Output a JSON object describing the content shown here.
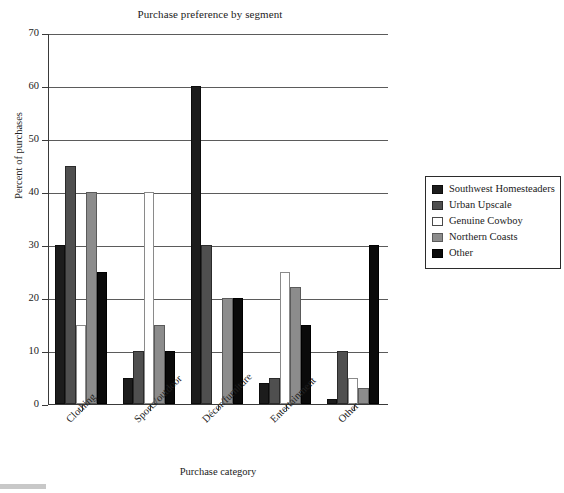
{
  "chart_data": {
    "type": "bar",
    "title": "Purchase preference by segment",
    "xlabel": "Purchase category",
    "ylabel": "Percent of purchases",
    "categories": [
      "Clothing",
      "Sports/outdoor",
      "Décor/furniture",
      "Entertainment",
      "Other"
    ],
    "series": [
      {
        "name": "Southwest Homesteaders",
        "color": "#1c1c1c",
        "values": [
          30,
          5,
          60,
          4,
          1
        ]
      },
      {
        "name": "Urban Upscale",
        "color": "#4f4f4f",
        "values": [
          45,
          10,
          30,
          5,
          10
        ]
      },
      {
        "name": "Genuine Cowboy",
        "color": "#ffffff",
        "values": [
          15,
          40,
          0,
          25,
          5
        ]
      },
      {
        "name": "Northern Coasts",
        "color": "#8c8c8c",
        "values": [
          40,
          15,
          20,
          22,
          3
        ]
      },
      {
        "name": "Other",
        "color": "#0a0a0a",
        "values": [
          25,
          10,
          20,
          15,
          30
        ]
      }
    ],
    "ylim": [
      0,
      70
    ],
    "yticks": [
      0,
      10,
      20,
      30,
      40,
      50,
      60,
      70
    ],
    "ytick_labels": [
      "0",
      "10",
      "20",
      "30",
      "40",
      "50",
      "60",
      "70"
    ],
    "grid": true,
    "legend_position": "right"
  },
  "legend": {
    "items": [
      {
        "label": "Southwest Homesteaders"
      },
      {
        "label": "Urban Upscale"
      },
      {
        "label": "Genuine Cowboy"
      },
      {
        "label": "Northern Coasts"
      },
      {
        "label": "Other"
      }
    ]
  }
}
